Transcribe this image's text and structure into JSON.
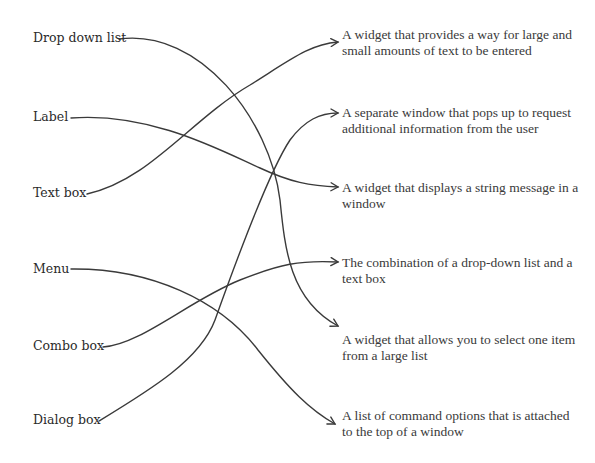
{
  "terms": [
    {
      "label": "Drop down list"
    },
    {
      "label": "Label"
    },
    {
      "label": "Text box"
    },
    {
      "label": "Menu"
    },
    {
      "label": "Combo box"
    },
    {
      "label": "Dialog box"
    }
  ],
  "definitions": [
    {
      "text": "A widget that provides a way for large and small amounts of text to be entered"
    },
    {
      "text": "A separate window that pops up to request additional information from the user"
    },
    {
      "text": "A widget that displays a string message in a window"
    },
    {
      "text": "The combination of a drop-down list and a text box"
    },
    {
      "text": "A widget that allows you to select one item from a large list"
    },
    {
      "text": "A list of command options that is attached to the top of a window"
    }
  ],
  "connections": [
    {
      "from": "Drop down list",
      "to": "A widget that allows you to select one item from a large list"
    },
    {
      "from": "Label",
      "to": "A widget that displays a string message in a window"
    },
    {
      "from": "Text box",
      "to": "A widget that provides a way for large and small amounts of text to be entered"
    },
    {
      "from": "Menu",
      "to": "A list of command options that is attached to the top of a window"
    },
    {
      "from": "Combo box",
      "to": "The combination of a drop-down list and a text box"
    },
    {
      "from": "Dialog box",
      "to": "A separate window that pops up to request additional information from the user"
    }
  ],
  "colors": {
    "line": "#3a3a3a",
    "text": "#2a2a2a",
    "background": "#ffffff"
  }
}
